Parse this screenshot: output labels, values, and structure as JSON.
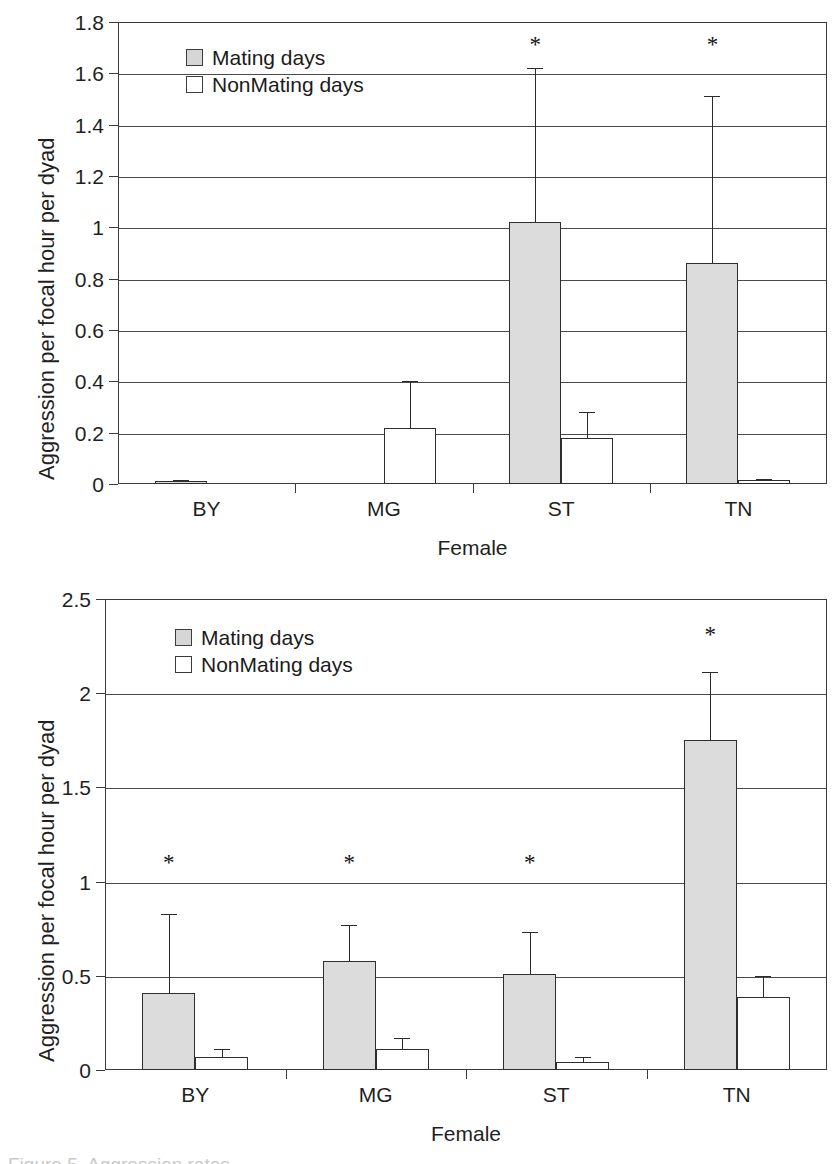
{
  "figure": {
    "caption_fragment": "Figure 5. Aggression rates"
  },
  "legend": {
    "items": [
      {
        "label": "Mating days",
        "swatch": "mating",
        "color": "#d6d6d6"
      },
      {
        "label": "NonMating days",
        "swatch": "nonmating",
        "color": "#ffffff"
      }
    ]
  },
  "charts": [
    {
      "id": "top-chart",
      "ylabel": "Aggression per focal hour per dyad",
      "xlabel": "Female",
      "yticks": [
        "0",
        "0.2",
        "0.4",
        "0.6",
        "0.8",
        "1",
        "1.2",
        "1.4",
        "1.6",
        "1.8"
      ],
      "categories": [
        "BY",
        "MG",
        "ST",
        "TN"
      ],
      "significance": [
        "",
        "",
        "*",
        "*"
      ]
    },
    {
      "id": "bottom-chart",
      "ylabel": "Aggression per focal hour per dyad",
      "xlabel": "Female",
      "yticks": [
        "0",
        "0.5",
        "1",
        "1.5",
        "2",
        "2.5"
      ],
      "categories": [
        "BY",
        "MG",
        "ST",
        "TN"
      ],
      "significance": [
        "*",
        "*",
        "*",
        "*"
      ]
    }
  ],
  "chart_data": [
    {
      "type": "bar",
      "id": "top-chart",
      "title": "",
      "xlabel": "Female",
      "ylabel": "Aggression per focal hour per dyad",
      "ylim": [
        0,
        1.8
      ],
      "ytick_values": [
        0,
        0.2,
        0.4,
        0.6,
        0.8,
        1.0,
        1.2,
        1.4,
        1.6,
        1.8
      ],
      "grid": true,
      "legend_position": "top-left-inside",
      "categories": [
        "BY",
        "MG",
        "ST",
        "TN"
      ],
      "series": [
        {
          "name": "Mating days",
          "color": "#d6d6d6",
          "values": [
            0.01,
            0.0,
            1.02,
            0.86
          ],
          "errors_upper": [
            0.015,
            0.0,
            1.62,
            1.51
          ]
        },
        {
          "name": "NonMating days",
          "color": "#ffffff",
          "values": [
            0.0,
            0.22,
            0.18,
            0.015
          ],
          "errors_upper": [
            0.0,
            0.4,
            0.28,
            0.02
          ]
        }
      ],
      "annotations": [
        {
          "text": "*",
          "category": "ST",
          "y": 1.71
        },
        {
          "text": "*",
          "category": "TN",
          "y": 1.71
        }
      ]
    },
    {
      "type": "bar",
      "id": "bottom-chart",
      "title": "",
      "xlabel": "Female",
      "ylabel": "Aggression per focal hour per dyad",
      "ylim": [
        0,
        2.5
      ],
      "ytick_values": [
        0,
        0.5,
        1.0,
        1.5,
        2.0,
        2.5
      ],
      "grid": true,
      "legend_position": "top-left-inside",
      "categories": [
        "BY",
        "MG",
        "ST",
        "TN"
      ],
      "series": [
        {
          "name": "Mating days",
          "color": "#d6d6d6",
          "values": [
            0.41,
            0.58,
            0.51,
            1.75
          ],
          "errors_upper": [
            0.83,
            0.77,
            0.73,
            2.11
          ]
        },
        {
          "name": "NonMating days",
          "color": "#ffffff",
          "values": [
            0.07,
            0.11,
            0.04,
            0.39
          ],
          "errors_upper": [
            0.11,
            0.17,
            0.07,
            0.5
          ]
        }
      ],
      "annotations": [
        {
          "text": "*",
          "category": "BY",
          "y": 1.1
        },
        {
          "text": "*",
          "category": "MG",
          "y": 1.1
        },
        {
          "text": "*",
          "category": "ST",
          "y": 1.1
        },
        {
          "text": "*",
          "category": "TN",
          "y": 2.31
        }
      ]
    }
  ]
}
